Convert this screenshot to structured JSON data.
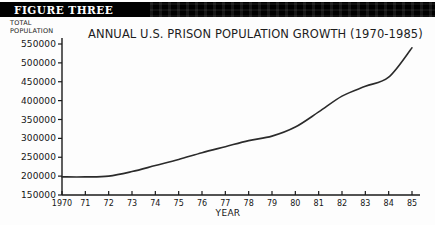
{
  "banner": {
    "figure_label": "FIGURE THREE"
  },
  "axis_caption": {
    "y_caption": "TOTAL\nPOPULATION"
  },
  "colors": {
    "banner_background": "#000000",
    "banner_text": "#ffffff",
    "line": "#2b2b2b",
    "axis": "#1a1a1a",
    "page_background": "#fdfdfd"
  },
  "chart_data": {
    "type": "line",
    "title": "ANNUAL U.S. PRISON POPULATION GROWTH (1970-1985)",
    "xlabel": "YEAR",
    "ylabel": "TOTAL POPULATION",
    "grid": false,
    "legend": false,
    "xlim": [
      1970,
      1985
    ],
    "ylim": [
      150000,
      550000
    ],
    "ytick_labels": [
      "550000",
      "500000",
      "450000",
      "400000",
      "350000",
      "300000",
      "250000",
      "200000",
      "150000"
    ],
    "ytick_values": [
      550000,
      500000,
      450000,
      400000,
      350000,
      300000,
      250000,
      200000,
      150000
    ],
    "xtick_labels": [
      "1970",
      "71",
      "72",
      "73",
      "74",
      "75",
      "76",
      "77",
      "78",
      "79",
      "80",
      "81",
      "82",
      "83",
      "84",
      "85"
    ],
    "x": [
      1970,
      1971,
      1972,
      1973,
      1974,
      1975,
      1976,
      1977,
      1978,
      1979,
      1980,
      1981,
      1982,
      1983,
      1984,
      1985
    ],
    "values": [
      198000,
      198000,
      200000,
      212000,
      228000,
      244000,
      262000,
      278000,
      294000,
      306000,
      330000,
      370000,
      412000,
      438000,
      462000,
      540000
    ]
  }
}
